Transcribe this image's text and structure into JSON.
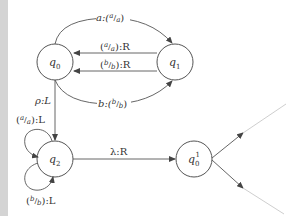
{
  "diagram": {
    "states": [
      {
        "id": "q0",
        "name": "q",
        "sub": "0",
        "sup": ""
      },
      {
        "id": "q1",
        "name": "q",
        "sub": "1",
        "sup": ""
      },
      {
        "id": "q2",
        "name": "q",
        "sub": "2",
        "sup": ""
      },
      {
        "id": "q0p",
        "name": "q",
        "sub": "0",
        "sup": "1"
      }
    ],
    "transitions": [
      {
        "from": "q0",
        "to": "q1",
        "label": "a:(a/a)"
      },
      {
        "from": "q1",
        "to": "q0",
        "label": "(a/a):R"
      },
      {
        "from": "q1",
        "to": "q0",
        "label": "(b/b):R"
      },
      {
        "from": "q0",
        "to": "q1",
        "label": "b:(b/b)"
      },
      {
        "from": "q0",
        "to": "q2",
        "label": "ρ:L"
      },
      {
        "from": "q2",
        "to": "q2",
        "label": "(a/a):L"
      },
      {
        "from": "q2",
        "to": "q2",
        "label": "(b/b):L"
      },
      {
        "from": "q2",
        "to": "q0p",
        "label": "λ:R"
      }
    ],
    "labels": {
      "t_a": "a:(",
      "t_a_num": "a",
      "t_a_den": "a",
      "t_a_close": ")",
      "t_aR_open": "(",
      "t_aR_num": "a",
      "t_aR_den": "a",
      "t_aR_close": "):R",
      "t_bR_open": "(",
      "t_bR_num": "b",
      "t_bR_den": "b",
      "t_bR_close": "):R",
      "t_b": "b:(",
      "t_b_num": "b",
      "t_b_den": "b",
      "t_b_close": ")",
      "t_rho": "ρ:L",
      "t_aL_open": "(",
      "t_aL_num": "a",
      "t_aL_den": "a",
      "t_aL_close": "):L",
      "t_bL_open": "(",
      "t_bL_num": "b",
      "t_bL_den": "b",
      "t_bL_close": "):L",
      "t_lambda": "λ:R",
      "q_name": "q",
      "q0_sub": "0",
      "q1_sub": "1",
      "q2_sub": "2",
      "q0p_sub": "0",
      "q0p_sup": "1"
    },
    "colors": {
      "stroke": "#555555",
      "text": "#333333",
      "fade": "#bbbbbb"
    }
  }
}
